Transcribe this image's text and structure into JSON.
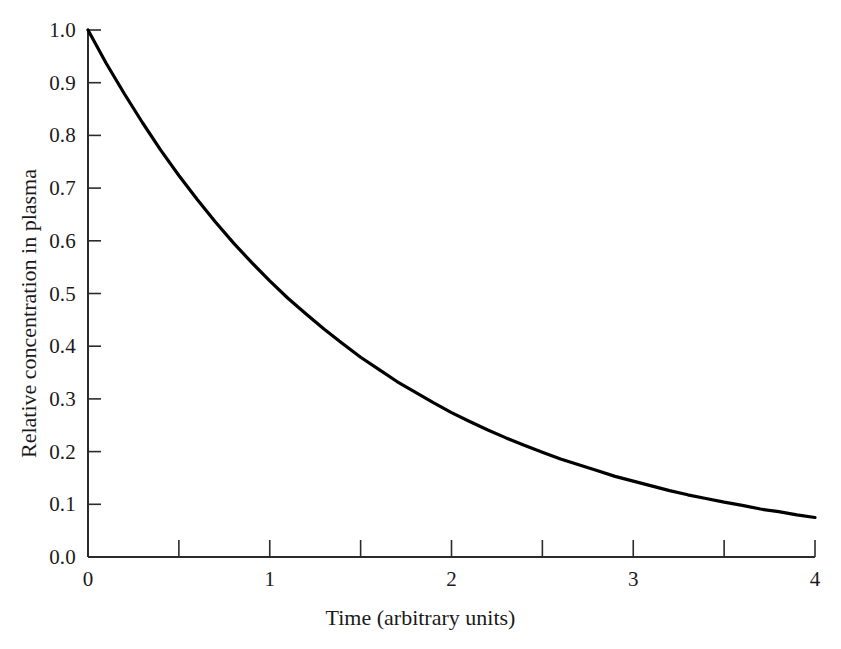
{
  "chart_data": {
    "type": "line",
    "title": "",
    "xlabel": "Time (arbitrary units)",
    "ylabel": "Relative concentration in plasma",
    "xlim": [
      0,
      4
    ],
    "ylim": [
      0.0,
      1.0
    ],
    "grid": false,
    "legend": null,
    "line_color": "#000000",
    "background_color": "#ffffff",
    "axis_color": "#2b2b2b",
    "xticks": [
      0,
      1,
      2,
      3,
      4
    ],
    "xtick_labels": [
      "0",
      "1",
      "2",
      "3",
      "4"
    ],
    "xminor_ticks": [
      0.5,
      1.5,
      2.5,
      3.5
    ],
    "yticks": [
      0.0,
      0.1,
      0.2,
      0.3,
      0.4,
      0.5,
      0.6,
      0.7,
      0.8,
      0.9,
      1.0
    ],
    "ytick_labels": [
      "0.0",
      "0.1",
      "0.2",
      "0.3",
      "0.4",
      "0.5",
      "0.6",
      "0.7",
      "0.8",
      "0.9",
      "1.0"
    ],
    "series": [
      {
        "name": "Relative plasma concentration",
        "description": "Single exponential decay, first-order elimination",
        "equation": "y = exp(-0.6466 * t)",
        "x": [
          0,
          0.1,
          0.2,
          0.3,
          0.4,
          0.5,
          0.6,
          0.7,
          0.8,
          0.9,
          1.0,
          1.1,
          1.2,
          1.3,
          1.4,
          1.5,
          1.6,
          1.7,
          1.8,
          1.9,
          2.0,
          2.1,
          2.2,
          2.3,
          2.4,
          2.5,
          2.6,
          2.7,
          2.8,
          2.9,
          3.0,
          3.1,
          3.2,
          3.3,
          3.4,
          3.5,
          3.6,
          3.7,
          3.8,
          3.9,
          4.0
        ],
        "y": [
          1.0,
          0.937,
          0.879,
          0.824,
          0.772,
          0.724,
          0.679,
          0.636,
          0.596,
          0.559,
          0.524,
          0.491,
          0.461,
          0.432,
          0.405,
          0.379,
          0.356,
          0.333,
          0.313,
          0.293,
          0.274,
          0.257,
          0.241,
          0.226,
          0.212,
          0.199,
          0.186,
          0.175,
          0.164,
          0.153,
          0.144,
          0.135,
          0.126,
          0.118,
          0.111,
          0.104,
          0.098,
          0.091,
          0.086,
          0.08,
          0.075
        ]
      }
    ],
    "annotations": []
  },
  "axis": {
    "y_title": "Relative concentration in plasma",
    "x_title": "Time (arbitrary units)"
  }
}
